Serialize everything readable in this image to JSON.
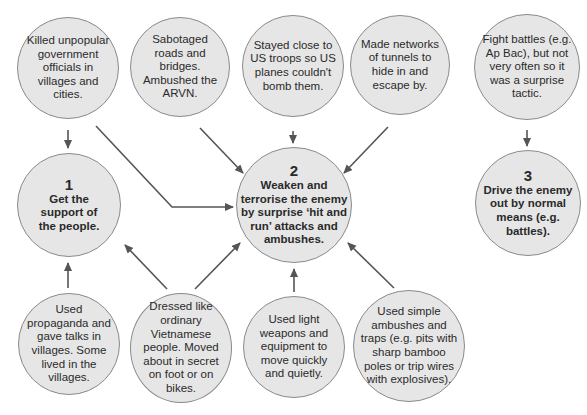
{
  "colors": {
    "node_fill": "#e6e6e6",
    "node_border": "#8a8a8a",
    "arrow": "#555555",
    "text": "#2a2a2a"
  },
  "top_row": [
    {
      "id": "t1",
      "text": "Killed unpopular government officials in villages and cities."
    },
    {
      "id": "t2",
      "text": "Sabotaged roads and bridges. Ambushed the ARVN."
    },
    {
      "id": "t3",
      "text": "Stayed close to US troops so US planes couldn't bomb them."
    },
    {
      "id": "t4",
      "text": "Made networks of tunnels to hide in and escape by."
    },
    {
      "id": "t5",
      "text": "Fight battles (e.g. Ap Bac), but not very often so it was a surprise tactic."
    }
  ],
  "key_nodes": [
    {
      "id": "k1",
      "number": "1",
      "text": "Get the support of the people."
    },
    {
      "id": "k2",
      "number": "2",
      "text": "Weaken and terrorise the enemy by surprise ‘hit and run’ attacks and ambushes."
    },
    {
      "id": "k3",
      "number": "3",
      "text": "Drive the enemy out by normal means (e.g. battles)."
    }
  ],
  "bottom_row": [
    {
      "id": "b1",
      "text": "Used propaganda and gave talks in villages. Some lived in the villages."
    },
    {
      "id": "b2",
      "text": "Dressed like ordinary Vietnamese people. Moved about in secret on foot or on bikes."
    },
    {
      "id": "b3",
      "text": "Used light weapons and equipment to move quickly and quietly."
    },
    {
      "id": "b4",
      "text": "Used simple ambushes and traps (e.g. pits with sharp bamboo poles or trip wires with explosives)."
    }
  ],
  "edges": [
    {
      "from": "t1",
      "to": "k1"
    },
    {
      "from": "t1",
      "to": "k2"
    },
    {
      "from": "t2",
      "to": "k2"
    },
    {
      "from": "t3",
      "to": "k2"
    },
    {
      "from": "t4",
      "to": "k2"
    },
    {
      "from": "t5",
      "to": "k3"
    },
    {
      "from": "b1",
      "to": "k1"
    },
    {
      "from": "b2",
      "to": "k1"
    },
    {
      "from": "b2",
      "to": "k2"
    },
    {
      "from": "b3",
      "to": "k2"
    },
    {
      "from": "b4",
      "to": "k2"
    }
  ]
}
